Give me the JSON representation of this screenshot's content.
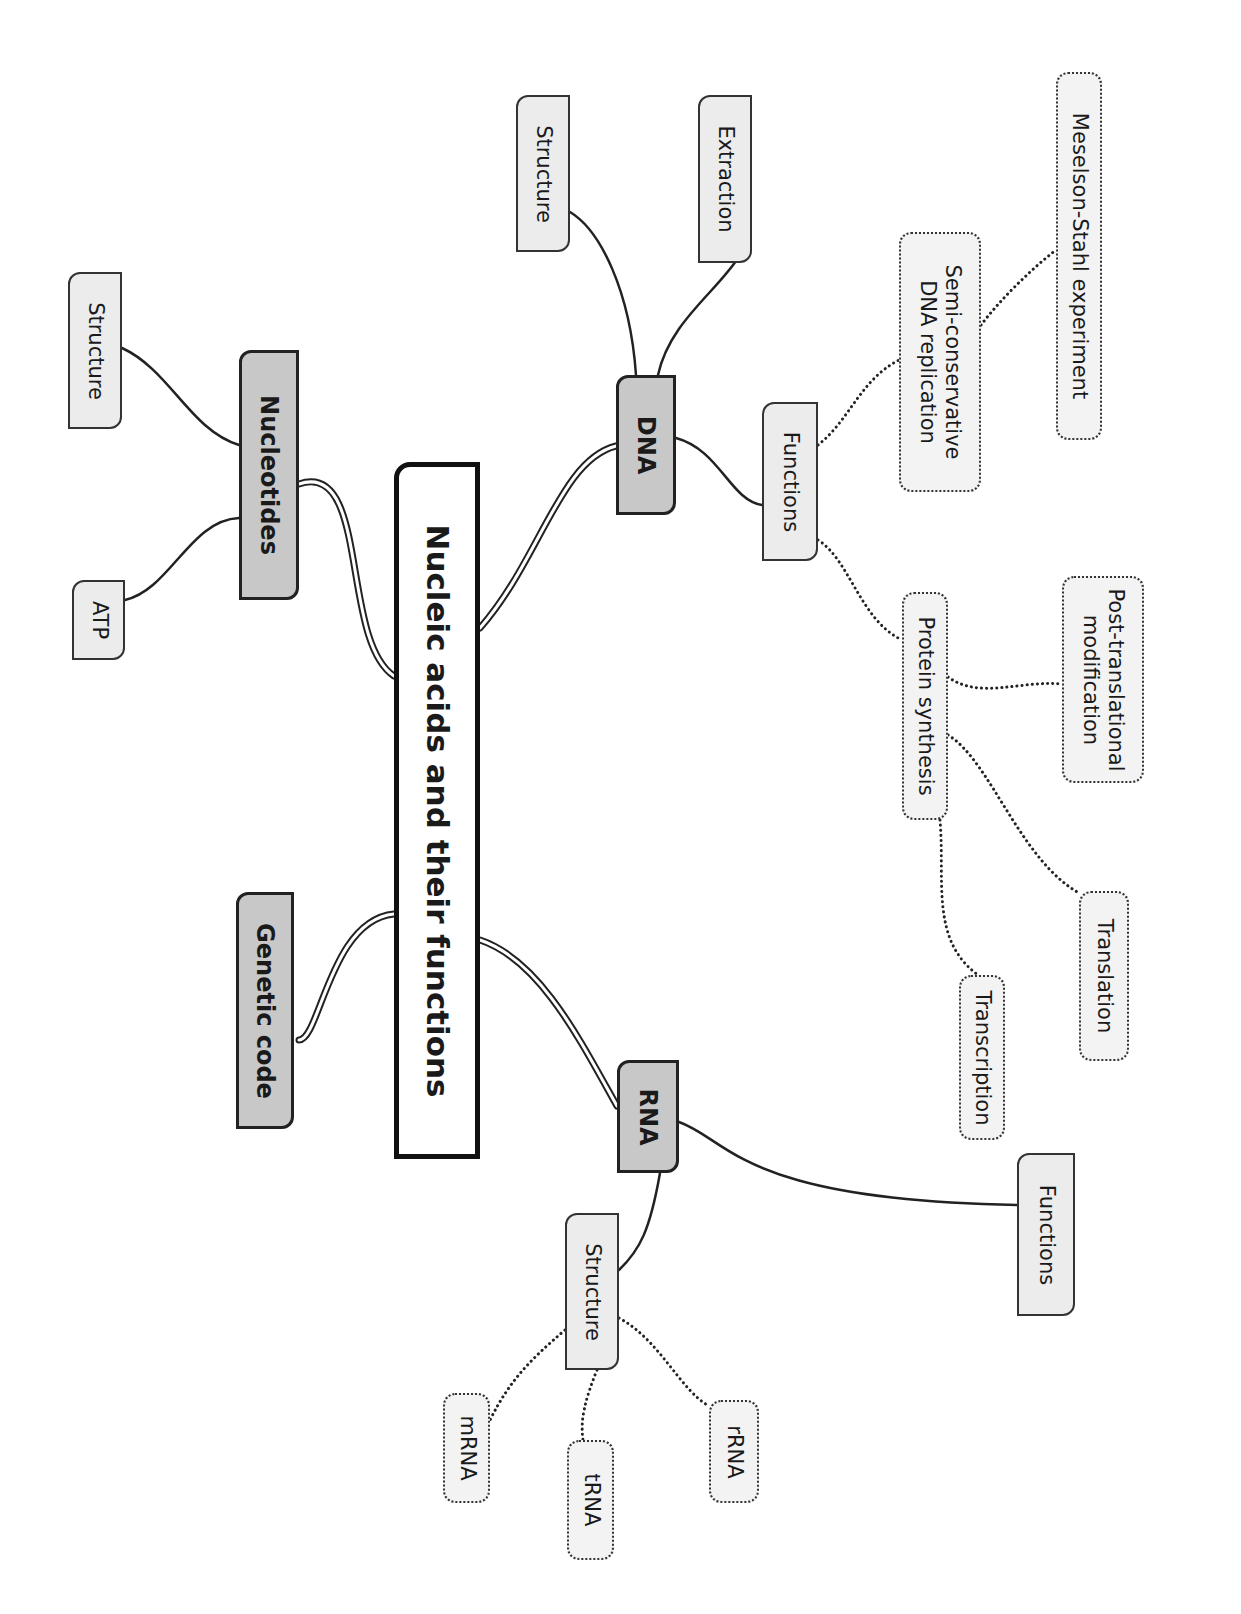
{
  "diagram": {
    "title": "Nucleic acids and their functions",
    "orientation": "rotated 90 degrees clockwise",
    "colors": {
      "main_fill": "#c8c8c8",
      "sub_fill": "#ececec",
      "leaf_fill": "#f3f3f3",
      "stroke": "#222222"
    },
    "nodes": [
      {
        "id": "root",
        "label": "Nucleic acids and their functions",
        "kind": "root",
        "x": 394,
        "y": 462,
        "w": 86,
        "h": 697
      },
      {
        "id": "dna",
        "label": "DNA",
        "kind": "main",
        "x": 616,
        "y": 375,
        "w": 60,
        "h": 140
      },
      {
        "id": "rna",
        "label": "RNA",
        "kind": "main",
        "x": 617,
        "y": 1060,
        "w": 62,
        "h": 113
      },
      {
        "id": "nucleotides",
        "label": "Nucleotides",
        "kind": "main",
        "x": 239,
        "y": 350,
        "w": 60,
        "h": 250
      },
      {
        "id": "genetic_code",
        "label": "Genetic code",
        "kind": "main",
        "x": 236,
        "y": 892,
        "w": 58,
        "h": 237
      },
      {
        "id": "dna_structure",
        "label": "Structure",
        "kind": "sub",
        "x": 516,
        "y": 95,
        "w": 54,
        "h": 157
      },
      {
        "id": "dna_extraction",
        "label": "Extraction",
        "kind": "sub",
        "x": 698,
        "y": 95,
        "w": 54,
        "h": 168
      },
      {
        "id": "dna_functions",
        "label": "Functions",
        "kind": "sub",
        "x": 762,
        "y": 402,
        "w": 56,
        "h": 159
      },
      {
        "id": "semi_conservative",
        "label": "Semi-conservative\nDNA replication",
        "kind": "leaf",
        "x": 899,
        "y": 232,
        "w": 82,
        "h": 260
      },
      {
        "id": "meselson_stahl",
        "label": "Meselson-Stahl experiment",
        "kind": "leaf",
        "x": 1056,
        "y": 72,
        "w": 46,
        "h": 368
      },
      {
        "id": "protein_synthesis",
        "label": "Protein synthesis",
        "kind": "leaf",
        "x": 902,
        "y": 592,
        "w": 46,
        "h": 228
      },
      {
        "id": "post_translational",
        "label": "Post-translational\nmodification",
        "kind": "leaf",
        "x": 1062,
        "y": 576,
        "w": 82,
        "h": 207
      },
      {
        "id": "translation",
        "label": "Translation",
        "kind": "leaf",
        "x": 1079,
        "y": 891,
        "w": 50,
        "h": 170
      },
      {
        "id": "transcription",
        "label": "Transcription",
        "kind": "leaf",
        "x": 959,
        "y": 975,
        "w": 46,
        "h": 165
      },
      {
        "id": "rna_functions",
        "label": "Functions",
        "kind": "sub",
        "x": 1017,
        "y": 1153,
        "w": 58,
        "h": 163
      },
      {
        "id": "rna_structure",
        "label": "Structure",
        "kind": "sub",
        "x": 565,
        "y": 1213,
        "w": 54,
        "h": 157
      },
      {
        "id": "mrna",
        "label": "mRNA",
        "kind": "leaf",
        "x": 443,
        "y": 1393,
        "w": 47,
        "h": 110
      },
      {
        "id": "trna",
        "label": "tRNA",
        "kind": "leaf",
        "x": 567,
        "y": 1440,
        "w": 47,
        "h": 120
      },
      {
        "id": "rrna",
        "label": "rRNA",
        "kind": "leaf",
        "x": 709,
        "y": 1400,
        "w": 50,
        "h": 103
      },
      {
        "id": "nuc_structure",
        "label": "Structure",
        "kind": "sub",
        "x": 68,
        "y": 272,
        "w": 54,
        "h": 157
      },
      {
        "id": "atp",
        "label": "ATP",
        "kind": "sub",
        "x": 72,
        "y": 580,
        "w": 53,
        "h": 80
      }
    ],
    "links": [
      {
        "from": "root",
        "to": "dna",
        "style": "double",
        "d": "M480,628 C540,560 560,460 616,446"
      },
      {
        "from": "root",
        "to": "rna",
        "style": "double",
        "d": "M480,940 C540,960 580,1040 617,1106"
      },
      {
        "from": "root",
        "to": "nucleotides",
        "style": "double",
        "d": "M394,676 C340,640 370,460 299,484"
      },
      {
        "from": "root",
        "to": "genetic_code",
        "style": "double",
        "d": "M394,914 C330,920 320,1040 299,1040"
      },
      {
        "from": "dna",
        "to": "dna_structure",
        "style": "solid",
        "d": "M636,375 C630,290 600,230 570,212"
      },
      {
        "from": "dna",
        "to": "dna_extraction",
        "style": "solid",
        "d": "M658,375 C670,320 720,290 742,252"
      },
      {
        "from": "dna",
        "to": "dna_functions",
        "style": "solid",
        "d": "M676,438 C720,450 730,500 762,505"
      },
      {
        "from": "dna_functions",
        "to": "semi_conservative",
        "style": "dotted",
        "d": "M818,445 C850,420 860,380 899,360"
      },
      {
        "from": "semi_conservative",
        "to": "meselson_stahl",
        "style": "dotted",
        "d": "M981,325 C1000,300 1030,270 1056,250"
      },
      {
        "from": "dna_functions",
        "to": "protein_synthesis",
        "style": "dotted",
        "d": "M818,540 C850,560 860,620 902,640"
      },
      {
        "from": "protein_synthesis",
        "to": "post_translational",
        "style": "dotted",
        "d": "M948,677 C980,700 1020,680 1062,684"
      },
      {
        "from": "protein_synthesis",
        "to": "translation",
        "style": "dotted",
        "d": "M948,735 C990,760 1020,860 1079,893"
      },
      {
        "from": "protein_synthesis",
        "to": "transcription",
        "style": "dotted",
        "d": "M940,820 C945,880 930,940 978,975"
      },
      {
        "from": "rna",
        "to": "rna_functions",
        "style": "solid",
        "d": "M679,1122 C730,1140 740,1200 1017,1205"
      },
      {
        "from": "rna",
        "to": "rna_structure",
        "style": "solid",
        "d": "M660,1173 C650,1230 640,1250 619,1270"
      },
      {
        "from": "rna_structure",
        "to": "mrna",
        "style": "dotted",
        "d": "M565,1330 C530,1360 510,1380 490,1420"
      },
      {
        "from": "rna_structure",
        "to": "trna",
        "style": "dotted",
        "d": "M597,1370 C585,1400 580,1420 583,1440"
      },
      {
        "from": "rna_structure",
        "to": "rrna",
        "style": "dotted",
        "d": "M619,1318 C660,1340 680,1390 709,1406"
      },
      {
        "from": "nucleotides",
        "to": "nuc_structure",
        "style": "solid",
        "d": "M239,445 C190,430 170,370 122,348"
      },
      {
        "from": "nucleotides",
        "to": "atp",
        "style": "solid",
        "d": "M239,518 C190,520 170,590 125,600"
      }
    ]
  }
}
